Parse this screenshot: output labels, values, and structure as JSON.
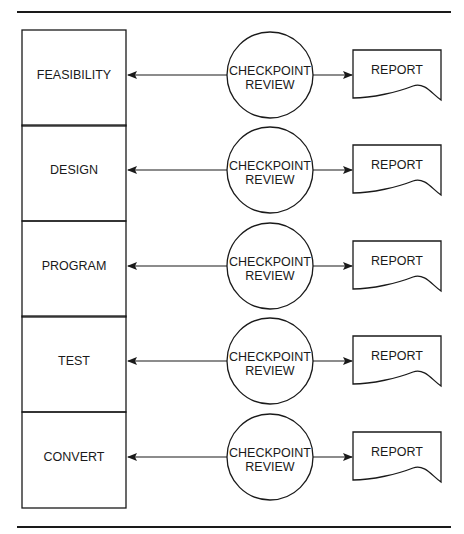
{
  "diagram": {
    "type": "flow",
    "phases": [
      {
        "label": "FEASIBILITY",
        "review_line1": "CHECKPOINT",
        "review_line2": "REVIEW",
        "output": "REPORT"
      },
      {
        "label": "DESIGN",
        "review_line1": "CHECKPOINT",
        "review_line2": "REVIEW",
        "output": "REPORT"
      },
      {
        "label": "PROGRAM",
        "review_line1": "CHECKPOINT",
        "review_line2": "REVIEW",
        "output": "REPORT"
      },
      {
        "label": "TEST",
        "review_line1": "CHECKPOINT",
        "review_line2": "REVIEW",
        "output": "REPORT"
      },
      {
        "label": "CONVERT",
        "review_line1": "CHECKPOINT",
        "review_line2": "REVIEW",
        "output": "REPORT"
      }
    ],
    "colors": {
      "line": "#1a1a1a",
      "background": "#ffffff"
    }
  }
}
